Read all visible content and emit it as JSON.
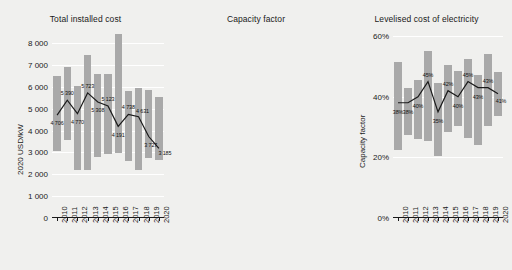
{
  "figure": {
    "background": "#f0f0ee",
    "band_color": "#a9a9a9",
    "line_color": "#1a1a1a"
  },
  "chart_data": [
    {
      "type": "bar",
      "id": "total-installed-cost",
      "title": "Total installed cost",
      "xlabel": "",
      "ylabel": "2020 USD/kW",
      "ylim": [
        0,
        8600
      ],
      "yticks": [
        0,
        1000,
        2000,
        3000,
        4000,
        5000,
        6000,
        7000,
        8000
      ],
      "ytick_labels": [
        "0",
        "1 000",
        "2 000",
        "3 000",
        "4 000",
        "5 000",
        "6 000",
        "7 000",
        "8 000"
      ],
      "grid": true,
      "legend": "none",
      "categories": [
        "2010",
        "2011",
        "2012",
        "2013",
        "2014",
        "2015",
        "2016",
        "2017",
        "2018",
        "2019",
        "2020"
      ],
      "series": [
        {
          "name": "5th-95th percentile range",
          "kind": "band",
          "low": [
            3050,
            3550,
            2200,
            2200,
            2800,
            2950,
            2950,
            2600,
            2200,
            2750,
            2650
          ],
          "high": [
            6500,
            6900,
            6050,
            7450,
            6600,
            6600,
            8400,
            5800,
            5950,
            5850,
            5550
          ]
        },
        {
          "name": "Capacity weighted average",
          "kind": "line",
          "values": [
            4706,
            5390,
            4770,
            5723,
            5308,
            5123,
            4191,
            4738,
            4631,
            3727,
            3185
          ],
          "labels": [
            "4 706",
            "5 390",
            "4 770",
            "5 723",
            "5 308",
            "5 123",
            "4 191",
            "4 738",
            "4 631",
            "3 727",
            "3 185"
          ]
        }
      ]
    },
    {
      "type": "bar",
      "id": "capacity-factor",
      "title": "Capacity factor",
      "xlabel": "",
      "ylabel": "Capacity factor",
      "ylim": [
        0,
        62
      ],
      "yticks": [
        0,
        20,
        40,
        60
      ],
      "ytick_labels": [
        "0%",
        "20%",
        "40%",
        "60%"
      ],
      "grid": true,
      "legend": "none",
      "categories": [
        "2010",
        "2011",
        "2012",
        "2013",
        "2014",
        "2015",
        "2016",
        "2017",
        "2018",
        "2019",
        "2020"
      ],
      "series": [
        {
          "name": "5th-95th percentile range",
          "kind": "band",
          "low": [
            22.5,
            27.5,
            26.0,
            25.5,
            20.5,
            28.5,
            30.5,
            26.5,
            24.0,
            30.5,
            33.5
          ],
          "high": [
            51.5,
            43.0,
            45.5,
            55.0,
            44.5,
            50.5,
            48.5,
            52.5,
            47.0,
            54.0,
            48.0
          ]
        },
        {
          "name": "Capacity weighted average",
          "kind": "line",
          "values": [
            38,
            38,
            40,
            45,
            35,
            42,
            40,
            45,
            43,
            43,
            41
          ],
          "labels": [
            "38%",
            "38%",
            "40%",
            "45%",
            "35%",
            "42%",
            "40%",
            "45%",
            "43%",
            "43%",
            "41%"
          ]
        }
      ]
    },
    {
      "type": "bar",
      "id": "levelised-cost-of-electricity",
      "title": "Levelised cost of electricity",
      "xlabel": "",
      "ylabel": "2020 USD/kWh",
      "ylim": [
        0,
        0.315
      ],
      "yticks": [
        0.0,
        0.05,
        0.1,
        0.15,
        0.2,
        0.25,
        0.3
      ],
      "ytick_labels": [
        "0.00",
        "0.05",
        "0.10",
        "0.15",
        "0.20",
        "0.25",
        "0.30"
      ],
      "grid": true,
      "legend": "none",
      "categories": [
        "2010",
        "2011",
        "2012",
        "2013",
        "2014",
        "2015",
        "2016",
        "2017",
        "2018",
        "2019",
        "2020"
      ],
      "series": [
        {
          "name": "5th-95th percentile range",
          "kind": "band",
          "low": [
            0.112,
            0.112,
            0.105,
            0.093,
            0.113,
            0.113,
            0.108,
            0.09,
            0.08,
            0.071,
            0.065
          ],
          "high": [
            0.265,
            0.22,
            0.201,
            0.258,
            0.193,
            0.199,
            0.3,
            0.155,
            0.178,
            0.126,
            0.191
          ]
        },
        {
          "name": "Capacity weighted average",
          "kind": "line",
          "values": [
            0.162,
            0.171,
            0.147,
            0.161,
            0.165,
            0.142,
            0.118,
            0.113,
            0.114,
            0.095,
            0.084
          ],
          "labels": [
            "0.162",
            "0.171",
            "0.147",
            "0.161",
            "0.165",
            "0.142",
            "0.118",
            "0.113",
            "0.114",
            "0.095",
            "0.084"
          ]
        }
      ]
    }
  ]
}
